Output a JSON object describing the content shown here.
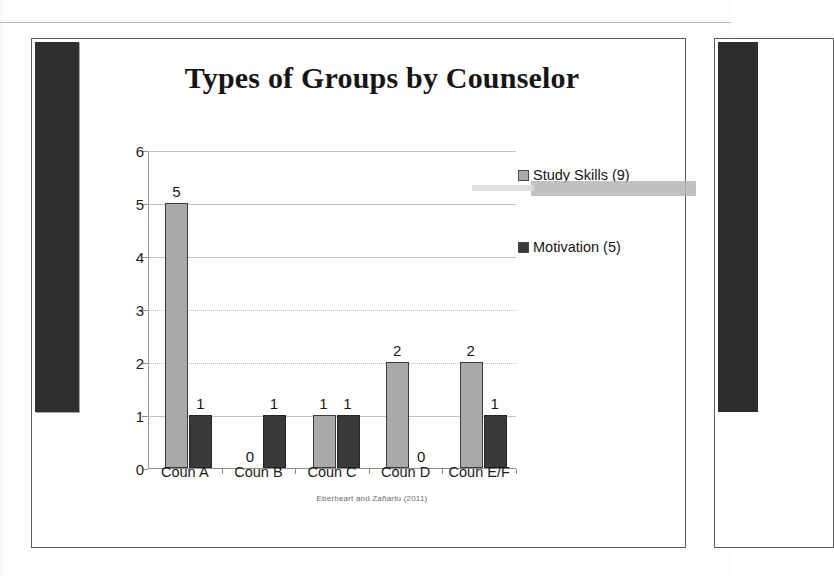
{
  "slide": {
    "title": "Types of Groups by Counselor",
    "citation": "Eberheart and Zañartu (2011)"
  },
  "legend": [
    {
      "label": "Study Skills (9)",
      "swatch": "#a9a9a9",
      "icon": "legend-swatch-study-skills"
    },
    {
      "label": "Motivation (5)",
      "swatch": "#3a3a3a",
      "icon": "legend-swatch-motivation"
    }
  ],
  "axis": {
    "y_ticks": [
      "6",
      "5",
      "4",
      "3",
      "2",
      "1",
      "0"
    ]
  },
  "chart_data": {
    "type": "bar",
    "title": "Types of Groups by Counselor",
    "xlabel": "",
    "ylabel": "",
    "ylim": [
      0,
      6
    ],
    "yticks": [
      0,
      1,
      2,
      3,
      4,
      5,
      6
    ],
    "grid": true,
    "legend_position": "right",
    "categories": [
      "Coun A",
      "Coun B",
      "Coun C",
      "Coun D",
      "Coun E/F"
    ],
    "series": [
      {
        "name": "Study Skills (9)",
        "color": "#a9a9a9",
        "values": [
          5,
          0,
          1,
          2,
          2
        ]
      },
      {
        "name": "Motivation (5)",
        "color": "#3a3a3a",
        "values": [
          1,
          1,
          1,
          0,
          1
        ]
      }
    ],
    "data_labels": [
      [
        "5",
        "0",
        "1",
        "2",
        "2"
      ],
      [
        "1",
        "1",
        "1",
        "0",
        "1"
      ]
    ],
    "annotation": "Eberheart and Zañartu (2011)"
  }
}
